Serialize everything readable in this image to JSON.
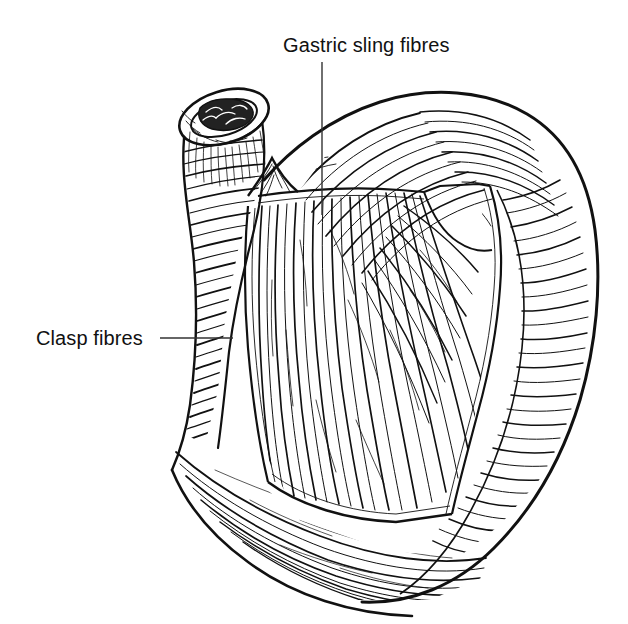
{
  "figure": {
    "kind": "anatomical-line-drawing",
    "background_color": "#ffffff",
    "ink_color": "#111111",
    "width": 628,
    "height": 624
  },
  "labels": [
    {
      "id": "gastric-sling-fibres",
      "text": "Gastric sling fibres",
      "text_x": 283,
      "text_y": 52,
      "anchor": "start",
      "leader": {
        "type": "vertical",
        "x1": 322,
        "y1": 62,
        "x2": 322,
        "y2": 215
      }
    },
    {
      "id": "clasp-fibres",
      "text": "Clasp fibres",
      "text_x": 36,
      "text_y": 345,
      "anchor": "start",
      "leader": {
        "type": "horizontal",
        "x1": 160,
        "y1": 338,
        "x2": 233,
        "y2": 338
      }
    }
  ],
  "structures": [
    {
      "id": "oesophagus-stump",
      "name": "Cut end of oesophagus"
    },
    {
      "id": "oesophagus-lumen",
      "name": "Oesophageal lumen with mucosal folds"
    },
    {
      "id": "oesophagus-body",
      "name": "Lower oesophagus with circular muscle bands"
    },
    {
      "id": "clasp-fibre-bands",
      "name": "Clasp fibres on lesser curve"
    },
    {
      "id": "gastric-fundus",
      "name": "Gastric fundus"
    },
    {
      "id": "greater-curvature",
      "name": "Greater curvature"
    },
    {
      "id": "dissection-window",
      "name": "Dissected window exposing sling fibres"
    },
    {
      "id": "sling-fibre-fan",
      "name": "Gastric sling fibres fanning from cardia"
    },
    {
      "id": "muscle-flap",
      "name": "Reflected outer muscle flap"
    },
    {
      "id": "angle-of-his",
      "name": "Angle of His"
    }
  ]
}
